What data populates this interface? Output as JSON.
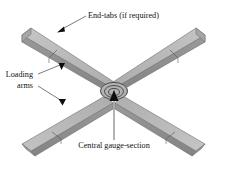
{
  "figure": {
    "background_color": "#ffffff",
    "canvas": {
      "width": 228,
      "height": 179
    }
  },
  "labels": {
    "end_tabs": "End-tabs (if required)",
    "loading_arms_line1": "Loading",
    "loading_arms_line2": "arms",
    "central_gauge": "Central gauge-section"
  },
  "colors": {
    "face_top": "#b6b6b6",
    "face_top_light": "#c2c2c2",
    "face_side": "#8d8d8d",
    "face_side_dark": "#7e7e7e",
    "face_end": "#a3a3a3",
    "outline": "#6e6e6e",
    "seam": "#5f5f5f",
    "text": "#101010",
    "leader": "#5a5a5a",
    "leader_thick": "#9a9a9a",
    "arrowhead": "#0d0d0d",
    "gauge_ring": "#2a2a2a"
  },
  "geometry": {
    "center": {
      "x": 114,
      "y": 92
    },
    "arm_count": 4,
    "gauge_rings": 3,
    "arms": [
      {
        "name": "arm-upper-left",
        "direction": "up-left",
        "has_end_tab": true
      },
      {
        "name": "arm-upper-right",
        "direction": "up-right",
        "has_end_tab": true
      },
      {
        "name": "arm-lower-left",
        "direction": "down-left",
        "has_end_tab": true
      },
      {
        "name": "arm-lower-right",
        "direction": "down-right",
        "has_end_tab": true
      }
    ]
  },
  "annotations": [
    {
      "name": "end-tabs-annotation",
      "target": "upper-left-arm-end-tab",
      "arrow": "down-left"
    },
    {
      "name": "loading-arms-annotation-upper",
      "target": "upper-left-arm",
      "arrow": "down-right"
    },
    {
      "name": "loading-arms-annotation-lower",
      "target": "lower-left-arm",
      "arrow": "down-right"
    },
    {
      "name": "central-gauge-annotation",
      "target": "central-gauge-section",
      "arrow": "up"
    }
  ]
}
